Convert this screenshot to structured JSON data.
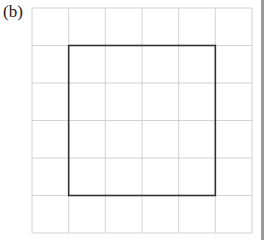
{
  "figure": {
    "label": "(b)",
    "grid": {
      "columns": 6,
      "rows": 6,
      "left": 32,
      "top": 8,
      "width": 220,
      "height": 225,
      "line_color": "#d2d2d2"
    },
    "square": {
      "from_col": 1,
      "to_col": 5,
      "from_row": 1,
      "to_row": 5,
      "stroke_color": "#333333",
      "side_in_units": 4
    }
  },
  "colors": {
    "background": "#ffffff",
    "grid_line": "#d2d2d2",
    "square_outline": "#333333",
    "side_bar": "#9a9a9a"
  }
}
